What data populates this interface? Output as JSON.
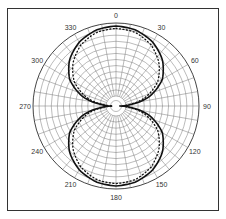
{
  "chart_data": {
    "type": "polar-line",
    "title": "",
    "angle_labels": [
      "0",
      "30",
      "60",
      "90",
      "120",
      "150",
      "180",
      "210",
      "240",
      "270",
      "300",
      "330"
    ],
    "angle_ticks_deg": [
      0,
      30,
      60,
      90,
      120,
      150,
      180,
      210,
      240,
      270,
      300,
      330
    ],
    "angular_grid_step_deg": 10,
    "radial_rings": 12,
    "direction": "clockwise",
    "zero_location": "top",
    "series": [
      {
        "name": "measured (solid)",
        "style": "solid",
        "pattern": "figure-eight / bidirectional",
        "theta_deg": [
          0,
          15,
          30,
          45,
          60,
          75,
          90,
          105,
          120,
          135,
          150,
          165,
          180,
          195,
          210,
          225,
          240,
          255,
          270,
          285,
          300,
          315,
          330,
          345
        ],
        "r": [
          1.0,
          0.98,
          0.92,
          0.82,
          0.67,
          0.42,
          0.05,
          0.42,
          0.67,
          0.82,
          0.92,
          0.98,
          1.0,
          0.98,
          0.92,
          0.82,
          0.67,
          0.42,
          0.05,
          0.42,
          0.67,
          0.82,
          0.92,
          0.98
        ]
      },
      {
        "name": "theoretical (dotted)",
        "style": "dotted",
        "pattern": "figure-eight / bidirectional",
        "theta_deg": [
          0,
          15,
          30,
          45,
          60,
          75,
          90,
          105,
          120,
          135,
          150,
          165,
          180,
          195,
          210,
          225,
          240,
          255,
          270,
          285,
          300,
          315,
          330,
          345
        ],
        "r": [
          0.97,
          0.95,
          0.88,
          0.76,
          0.6,
          0.36,
          0.04,
          0.36,
          0.6,
          0.76,
          0.88,
          0.95,
          0.97,
          0.95,
          0.88,
          0.76,
          0.6,
          0.36,
          0.04,
          0.36,
          0.6,
          0.76,
          0.88,
          0.95
        ]
      }
    ],
    "rlim": [
      0,
      1
    ],
    "grid": true,
    "legend": "none"
  },
  "geometry": {
    "cx": 116,
    "cy": 106,
    "radius": 83,
    "inner_radius": 10
  }
}
